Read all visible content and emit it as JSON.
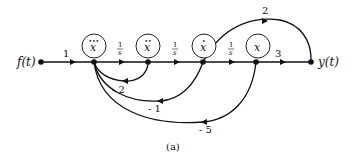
{
  "figure": {
    "caption": "(a)",
    "type": "signal-flow-graph"
  },
  "nodes": {
    "input": {
      "label": "f(t)"
    },
    "output": {
      "label": "y(t)"
    },
    "states": [
      {
        "id": "x3dot",
        "symbol": "x",
        "dots": "•••"
      },
      {
        "id": "x2dot",
        "symbol": "x",
        "dots": "••"
      },
      {
        "id": "x1dot",
        "symbol": "x",
        "dots": "•"
      },
      {
        "id": "x",
        "symbol": "x",
        "dots": ""
      }
    ]
  },
  "forward_branches": [
    {
      "from": "f(t)",
      "to": "x3dot",
      "gain": "1"
    },
    {
      "from": "x3dot",
      "to": "x2dot",
      "gain_num": "1",
      "gain_den": "s"
    },
    {
      "from": "x2dot",
      "to": "x1dot",
      "gain_num": "1",
      "gain_den": "s"
    },
    {
      "from": "x1dot",
      "to": "x",
      "gain_num": "1",
      "gain_den": "s"
    },
    {
      "from": "x",
      "to": "y(t)",
      "gain": "3"
    },
    {
      "from": "x1dot",
      "to": "y(t)",
      "gain": "2"
    }
  ],
  "feedback_branches": [
    {
      "from": "x2dot",
      "to": "x3dot",
      "gain": "- 2"
    },
    {
      "from": "x1dot",
      "to": "x3dot",
      "gain": "- 1"
    },
    {
      "from": "x",
      "to": "x3dot",
      "gain": "- 5"
    }
  ]
}
